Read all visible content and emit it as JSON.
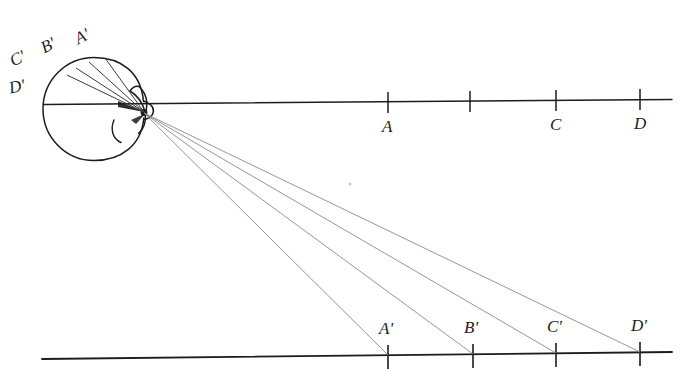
{
  "figure": {
    "ink_color": "#1c1c1c",
    "ray_color": "#7a7a7a",
    "background_color": "#ffffff"
  },
  "eye": {
    "name": "schematic-eye",
    "globe_center_x": 94,
    "globe_center_y": 109,
    "globe_radius": 51,
    "nodal_point_x": 143,
    "nodal_point_y": 113
  },
  "optical_axis": {
    "label": "",
    "x_start": 44,
    "x_end": 672,
    "y_left": 104,
    "y_right": 100
  },
  "object_line": {
    "name": "object-line",
    "ticks": [
      {
        "label": "A",
        "x": 388,
        "y": 102
      },
      {
        "label": "",
        "x": 470,
        "y": 101
      },
      {
        "label": "C",
        "x": 556,
        "y": 100
      },
      {
        "label": "D",
        "x": 640,
        "y": 99
      }
    ]
  },
  "image_line": {
    "name": "image-line",
    "x_start": 42,
    "x_end": 672,
    "y_left": 359,
    "y_right": 352,
    "ticks": [
      {
        "label": "A'",
        "x": 388,
        "y": 355
      },
      {
        "label": "B'",
        "x": 473,
        "y": 354
      },
      {
        "label": "C'",
        "x": 556,
        "y": 353
      },
      {
        "label": "D'",
        "x": 640,
        "y": 352
      }
    ]
  },
  "retina_labels": [
    {
      "label": "C'",
      "x": 12,
      "y": 53
    },
    {
      "label": "B'",
      "x": 42,
      "y": 40
    },
    {
      "label": "A'",
      "x": 76,
      "y": 31
    },
    {
      "label": "D'",
      "x": 10,
      "y": 80
    }
  ],
  "rays": [
    {
      "name": "ray-a",
      "retina_x": 105,
      "retina_y": 58,
      "target_x": 388,
      "target_y": 355
    },
    {
      "name": "ray-b",
      "retina_x": 89,
      "retina_y": 62,
      "target_x": 473,
      "target_y": 354
    },
    {
      "name": "ray-c",
      "retina_x": 76,
      "retina_y": 68,
      "target_x": 556,
      "target_y": 353
    },
    {
      "name": "ray-d",
      "retina_x": 67,
      "retina_y": 75,
      "target_x": 640,
      "target_y": 352
    }
  ],
  "artifacts": [
    {
      "name": "scan-speck",
      "x": 350,
      "y": 184,
      "r": 1.6
    }
  ]
}
